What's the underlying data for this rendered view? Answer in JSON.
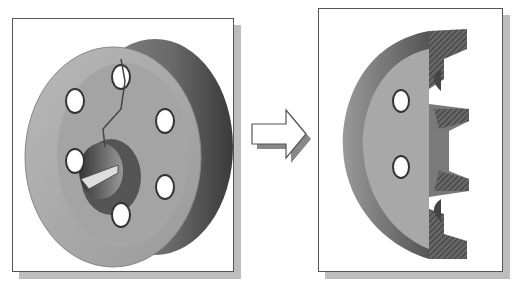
{
  "figure": {
    "left_panel": {
      "label": "Full part view",
      "description": "Flange with 6 bolt holes and keyed center bore"
    },
    "arrow": {
      "direction": "right"
    },
    "right_panel": {
      "label": "Section view",
      "description": "Half section of flange with hatched cut faces"
    }
  },
  "colors": {
    "part_face": "#a9a9a9",
    "part_dark": "#5a5a5a",
    "frame_border": "#555555",
    "shadow": "#bdbdbd"
  }
}
